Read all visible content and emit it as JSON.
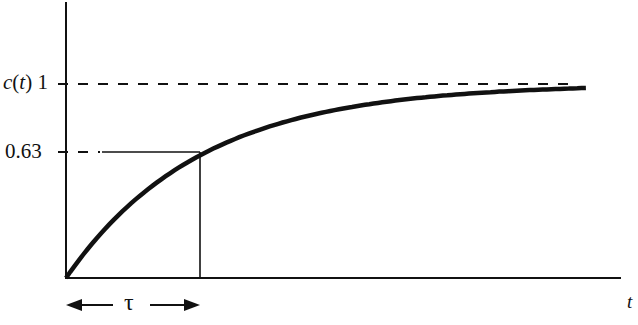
{
  "chart_data": {
    "type": "line",
    "title": "",
    "xlabel": "t",
    "ylabel": "c(t)",
    "y_ticks": [
      {
        "value": 1,
        "label": "1"
      },
      {
        "value": 0.63,
        "label": "0.63"
      }
    ],
    "x_annotation": {
      "label": "τ",
      "span": [
        0,
        1
      ],
      "style": "double-arrow"
    },
    "reference_lines": [
      {
        "type": "horizontal",
        "y": 1,
        "style": "dashed",
        "label": "final value"
      },
      {
        "type": "horizontal",
        "y": 0.63,
        "style": "dashed-then-solid",
        "x_end": 1
      },
      {
        "type": "vertical",
        "x": 1,
        "style": "solid",
        "y_end": 0.63
      }
    ],
    "series": [
      {
        "name": "c(t)",
        "x_unit": "tau",
        "x": [
          0,
          0.25,
          0.5,
          0.75,
          1,
          1.5,
          2,
          2.5,
          3,
          3.5,
          3.9
        ],
        "values": [
          0,
          0.22,
          0.39,
          0.53,
          0.63,
          0.78,
          0.86,
          0.92,
          0.95,
          0.97,
          0.98
        ]
      }
    ],
    "xlim": [
      0,
      4.1
    ],
    "ylim": [
      0,
      1.4
    ],
    "grid": false,
    "legend": "none"
  },
  "labels": {
    "y_axis_name": "c",
    "y_axis_arg": "t",
    "y_tick_one": "1",
    "y_tick_063": "0.63",
    "x_axis_name": "t",
    "tau": "τ"
  }
}
